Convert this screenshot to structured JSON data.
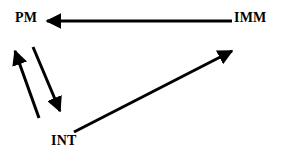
{
  "diagram": {
    "background_color": "#ffffff",
    "stroke_color": "#000000",
    "nodes": [
      {
        "id": "PM",
        "label": "PM",
        "x": 15,
        "y": 11
      },
      {
        "id": "IMM",
        "label": "IMM",
        "x": 234,
        "y": 11
      },
      {
        "id": "INT",
        "label": "INT",
        "x": 51,
        "y": 134
      }
    ],
    "edges": [
      {
        "id": "imm-to-pm",
        "from": "IMM",
        "to": "PM",
        "style": "solid",
        "arrowhead": "end",
        "direction": "leftward-horizontal"
      },
      {
        "id": "int-to-pm",
        "from": "INT",
        "to": "PM",
        "style": "solid",
        "arrowhead": "end",
        "direction": "up-left-diagonal"
      },
      {
        "id": "pm-to-int",
        "from": "PM",
        "to": "INT",
        "style": "solid",
        "arrowhead": "end",
        "direction": "down-right-diagonal"
      },
      {
        "id": "int-to-imm",
        "from": "INT",
        "to": "IMM",
        "style": "solid",
        "arrowhead": "end",
        "direction": "up-right-diagonal"
      }
    ]
  }
}
